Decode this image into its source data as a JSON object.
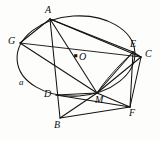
{
  "figure": {
    "background_color": "#fdfdfc",
    "stroke_color": "#121212",
    "canvas": {
      "width": 160,
      "height": 141
    },
    "conic": {
      "name": "ellipse-circle",
      "center_x": 76,
      "center_y": 56,
      "radius_x": 59,
      "radius_y": 40,
      "rotation_deg": -4
    },
    "points": [
      {
        "id": "A",
        "label": "A",
        "x": 50,
        "y": 19,
        "label_x": 45,
        "label_y": 5,
        "on_conic": true
      },
      {
        "id": "G",
        "label": "G",
        "x": 20,
        "y": 43,
        "label_x": 8,
        "label_y": 36,
        "on_conic": true
      },
      {
        "id": "O",
        "label": "O",
        "x": 76,
        "y": 56,
        "label_x": 79,
        "label_y": 52,
        "on_conic": false
      },
      {
        "id": "E",
        "label": "E",
        "x": 133,
        "y": 52,
        "label_x": 130,
        "label_y": 39,
        "on_conic": true
      },
      {
        "id": "C",
        "label": "C",
        "x": 141,
        "y": 57,
        "label_x": 145,
        "label_y": 49,
        "on_conic": false
      },
      {
        "id": "D",
        "label": "D",
        "x": 56,
        "y": 95,
        "label_x": 44,
        "label_y": 89,
        "on_conic": true
      },
      {
        "id": "M",
        "label": "M",
        "x": 97,
        "y": 93,
        "label_x": 95,
        "label_y": 95,
        "on_conic": false
      },
      {
        "id": "B",
        "label": "B",
        "x": 60,
        "y": 118,
        "label_x": 54,
        "label_y": 120,
        "on_conic": false
      },
      {
        "id": "F",
        "label": "F",
        "x": 130,
        "y": 107,
        "label_x": 129,
        "label_y": 108,
        "on_conic": false
      }
    ],
    "arc_label": {
      "id": "a",
      "label": "a",
      "x": 19,
      "y": 78
    },
    "segments": [
      {
        "name": "A-G",
        "from": "A",
        "to": "G"
      },
      {
        "name": "A-E",
        "from": "A",
        "to": "E"
      },
      {
        "name": "A-C",
        "from": "A",
        "to": "C"
      },
      {
        "name": "A-B",
        "from": "A",
        "to": "B"
      },
      {
        "name": "A-M",
        "from": "A",
        "to": "M"
      },
      {
        "name": "G-M",
        "from": "G",
        "to": "M"
      },
      {
        "name": "G-C",
        "from": "G",
        "to": "C"
      },
      {
        "name": "D-M",
        "from": "D",
        "to": "M"
      },
      {
        "name": "D-F",
        "from": "D",
        "to": "F"
      },
      {
        "name": "B-M",
        "from": "B",
        "to": "M"
      },
      {
        "name": "B-F",
        "from": "B",
        "to": "F"
      },
      {
        "name": "M-C",
        "from": "M",
        "to": "C"
      },
      {
        "name": "M-E",
        "from": "M",
        "to": "E"
      },
      {
        "name": "M-F",
        "from": "M",
        "to": "F"
      },
      {
        "name": "E-C",
        "from": "E",
        "to": "C"
      },
      {
        "name": "C-F",
        "from": "C",
        "to": "F"
      },
      {
        "name": "E-F",
        "from": "E",
        "to": "F"
      }
    ],
    "curves": [
      {
        "name": "arc-E-M",
        "note": "short arc bulging left from E down to M"
      }
    ]
  }
}
